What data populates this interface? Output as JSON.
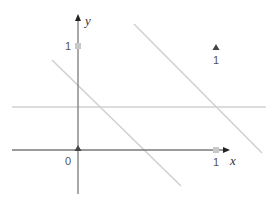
{
  "diagram": {
    "type": "coordinate-plane",
    "axes": {
      "x_label": "x",
      "y_label": "y",
      "origin_label": "0",
      "x_tick_label": "1",
      "y_tick_label": "1",
      "axis_color": "#7a7a7a",
      "arrow_color": "#222222"
    },
    "markers": {
      "origin_marker": "triangle-up",
      "origin_marker_color": "#444444",
      "unit_marker": "square",
      "unit_marker_color": "#c8c8c8"
    },
    "legend_marker": {
      "shape": "triangle-up",
      "label": "1",
      "color": "#444444"
    },
    "lines": [
      {
        "name": "horizontal-line",
        "color": "#d0d0d0",
        "description": "horizontal line above x-axis"
      },
      {
        "name": "diagonal-line-left",
        "color": "#d0d0d0",
        "description": "decreasing line crossing y-axis below 1"
      },
      {
        "name": "diagonal-line-right",
        "color": "#d0d0d0",
        "description": "decreasing line in upper right"
      }
    ]
  }
}
